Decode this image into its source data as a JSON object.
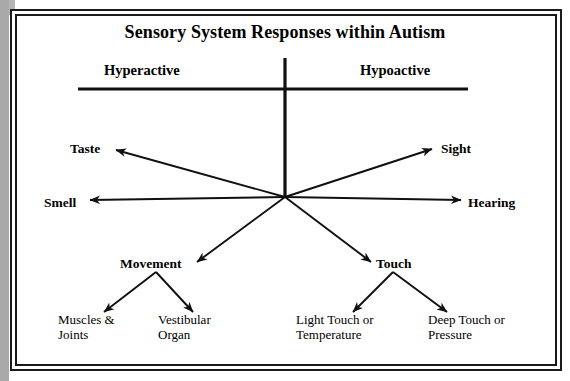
{
  "diagram": {
    "title": "Sensory System Responses within Autism",
    "axis": {
      "left_label": "Hyperactive",
      "right_label": "Hypoactive"
    },
    "hub": {
      "x": 285,
      "y": 197
    },
    "senses": [
      {
        "id": "taste",
        "label": "Taste",
        "side": "left",
        "x": 70,
        "y": 150
      },
      {
        "id": "smell",
        "label": "Smell",
        "side": "left",
        "x": 44,
        "y": 205
      },
      {
        "id": "sight",
        "label": "Sight",
        "side": "right",
        "x": 441,
        "y": 150
      },
      {
        "id": "hearing",
        "label": "Hearing",
        "side": "right",
        "x": 468,
        "y": 205
      },
      {
        "id": "movement",
        "label": "Movement",
        "side": "left",
        "x": 120,
        "y": 265
      },
      {
        "id": "touch",
        "label": "Touch",
        "side": "right",
        "x": 376,
        "y": 265
      }
    ],
    "leaves": [
      {
        "id": "muscles-joints",
        "parent": "movement",
        "line1": "Muscles &",
        "line2": "Joints",
        "x": 58,
        "y": 318
      },
      {
        "id": "vestibular-organ",
        "parent": "movement",
        "line1": "Vestibular",
        "line2": "Organ",
        "x": 158,
        "y": 318
      },
      {
        "id": "light-touch-temperature",
        "parent": "touch",
        "line1": "Light Touch or",
        "line2": "Temperature",
        "x": 296,
        "y": 318
      },
      {
        "id": "deep-touch-pressure",
        "parent": "touch",
        "line1": "Deep Touch or",
        "line2": "Pressure",
        "x": 428,
        "y": 318
      }
    ],
    "colors": {
      "ink": "#000000",
      "frame": "#1a1a1a",
      "paper": "#ffffff",
      "scan_edge": "#a9a9a9"
    }
  }
}
